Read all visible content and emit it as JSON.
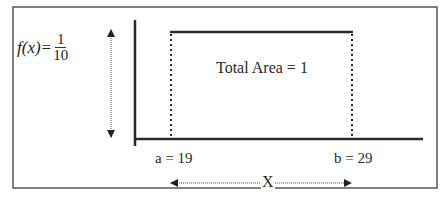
{
  "diagram": {
    "type": "uniform-distribution",
    "function_label": {
      "name": "f(x)",
      "equals": "=",
      "numerator": "1",
      "denominator": "10"
    },
    "area_label": "Total Area = 1",
    "lower_bound_label": "a = 19",
    "upper_bound_label": "b = 29",
    "x_axis_label": "X",
    "a": 19,
    "b": 29,
    "height": 0.1,
    "line_color": "#2b2b2b",
    "frame_color": "#555555"
  }
}
